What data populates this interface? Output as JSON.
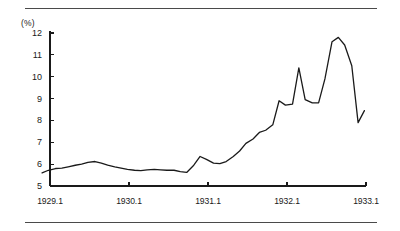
{
  "figure": {
    "unit_label": "(%)",
    "rules": {
      "top": "divider-line",
      "bottom": "divider-line"
    }
  },
  "chart_data": {
    "type": "line",
    "title": "",
    "subtitle": "",
    "xlabel": "",
    "ylabel": "(%)",
    "ylim": [
      5,
      12
    ],
    "xlim": [
      1929.0,
      1933.1
    ],
    "grid": false,
    "legend": null,
    "line_color": "#1a1a1a",
    "line_width": 1.3,
    "y_ticks": [
      5,
      6,
      7,
      8,
      9,
      10,
      11,
      12
    ],
    "y_tick_labels": [
      "5",
      "6",
      "7",
      "8",
      "9",
      "10",
      "11",
      "12"
    ],
    "x_ticks": [
      1929.1,
      1930.1,
      1931.1,
      1932.1,
      1933.1
    ],
    "x_tick_labels": [
      "1929.1",
      "1930.1",
      "1931.1",
      "1932.1",
      "1933.1"
    ],
    "series": [
      {
        "name": "rate",
        "x": [
          1929.0,
          1929.08,
          1929.17,
          1929.25,
          1929.33,
          1929.42,
          1929.5,
          1929.58,
          1929.67,
          1929.75,
          1929.83,
          1929.92,
          1930.0,
          1930.08,
          1930.17,
          1930.25,
          1930.33,
          1930.42,
          1930.5,
          1930.58,
          1930.67,
          1930.75,
          1930.83,
          1930.92,
          1931.0,
          1931.08,
          1931.17,
          1931.25,
          1931.33,
          1931.42,
          1931.5,
          1931.58,
          1931.67,
          1931.75,
          1931.83,
          1931.92,
          1932.0,
          1932.08,
          1932.17,
          1932.25,
          1932.33,
          1932.42,
          1932.5,
          1932.58,
          1932.67,
          1932.75,
          1932.83,
          1932.92,
          1933.0,
          1933.08
        ],
        "values": [
          5.6,
          5.72,
          5.8,
          5.82,
          5.88,
          5.95,
          6.0,
          6.08,
          6.12,
          6.05,
          5.96,
          5.88,
          5.82,
          5.76,
          5.72,
          5.7,
          5.74,
          5.76,
          5.74,
          5.72,
          5.72,
          5.66,
          5.62,
          5.95,
          6.35,
          6.22,
          6.05,
          6.02,
          6.12,
          6.35,
          6.6,
          6.95,
          7.15,
          7.45,
          7.55,
          7.8,
          8.9,
          8.7,
          8.75,
          10.4,
          8.95,
          8.8,
          8.8,
          9.9,
          11.6,
          11.8,
          11.45,
          10.5,
          7.9,
          8.45
        ]
      }
    ],
    "annotations": []
  }
}
